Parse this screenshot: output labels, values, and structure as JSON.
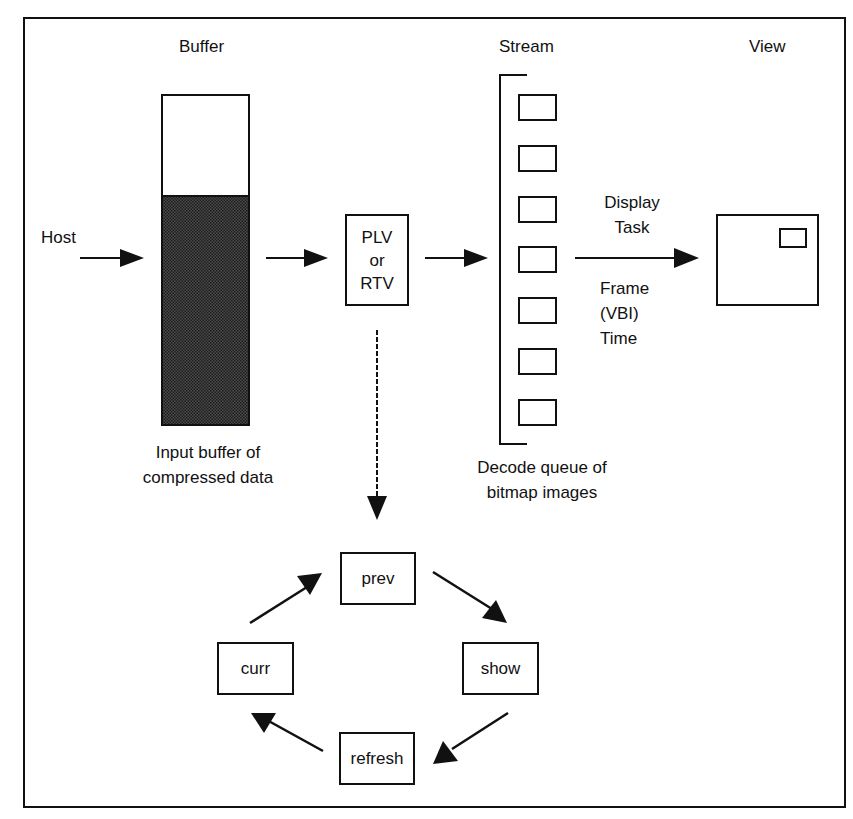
{
  "diagram": {
    "type": "flow",
    "section_headers": {
      "buffer": "Buffer",
      "stream": "Stream",
      "view": "View"
    },
    "host_label": "Host",
    "buffer_caption_line1": "Input buffer of",
    "buffer_caption_line2": "compressed data",
    "decoder_line1": "PLV",
    "decoder_line2": "or",
    "decoder_line3": "RTV",
    "queue_caption_line1": "Decode queue of",
    "queue_caption_line2": "bitmap images",
    "queue_slot_count": 7,
    "display_task_line1": "Display",
    "display_task_line2": "Task",
    "frame_time_line1": "Frame",
    "frame_time_line2": "(VBI)",
    "frame_time_line3": "Time",
    "cycle": {
      "top": "prev",
      "right": "show",
      "bottom": "refresh",
      "left": "curr"
    },
    "colors": {
      "line": "#111111",
      "buffer_fill": "#3a3a3a",
      "background": "#ffffff"
    }
  }
}
